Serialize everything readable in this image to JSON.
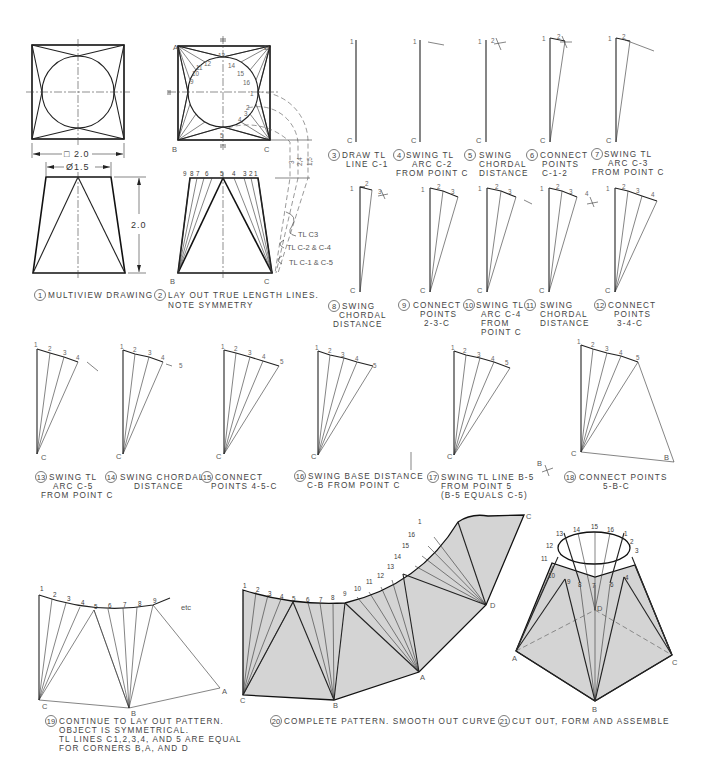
{
  "figure": {
    "steps": [
      {
        "n": "1",
        "lines": [
          "MULTIVIEW DRAWING"
        ]
      },
      {
        "n": "2",
        "lines": [
          "LAY OUT TRUE LENGTH LINES.",
          "NOTE SYMMETRY"
        ]
      },
      {
        "n": "3",
        "lines": [
          "DRAW TL",
          "LINE C-1"
        ]
      },
      {
        "n": "4",
        "lines": [
          "SWING TL",
          "ARC C-2",
          "FROM POINT C"
        ]
      },
      {
        "n": "5",
        "lines": [
          "SWING",
          "CHORDAL",
          "DISTANCE"
        ]
      },
      {
        "n": "6",
        "lines": [
          "CONNECT",
          "POINTS",
          "C-1-2"
        ]
      },
      {
        "n": "7",
        "lines": [
          "SWING TL",
          "ARC C-3",
          "FROM POINT C"
        ]
      },
      {
        "n": "8",
        "lines": [
          "SWING",
          "CHORDAL",
          "DISTANCE"
        ]
      },
      {
        "n": "9",
        "lines": [
          "CONNECT",
          "POINTS",
          "2-3-C"
        ]
      },
      {
        "n": "10",
        "lines": [
          "SWING TL",
          "ARC C-4",
          "FROM",
          "POINT C"
        ]
      },
      {
        "n": "11",
        "lines": [
          "SWING",
          "CHORDAL",
          "DISTANCE"
        ]
      },
      {
        "n": "12",
        "lines": [
          "CONNECT",
          "POINTS",
          "3-4-C"
        ]
      },
      {
        "n": "13",
        "lines": [
          "SWING TL",
          "ARC C-5",
          "FROM POINT C"
        ]
      },
      {
        "n": "14",
        "lines": [
          "SWING CHORDAL",
          "DISTANCE"
        ]
      },
      {
        "n": "15",
        "lines": [
          "CONNECT",
          "POINTS 4-5-C"
        ]
      },
      {
        "n": "16",
        "lines": [
          "SWING BASE DISTANCE",
          "C-B FROM POINT C"
        ]
      },
      {
        "n": "17",
        "lines": [
          "SWING TL LINE B-5",
          "FROM POINT 5",
          "(B-5 EQUALS C-5)"
        ]
      },
      {
        "n": "18",
        "lines": [
          "CONNECT POINTS",
          "5-B-C"
        ]
      },
      {
        "n": "19",
        "lines": [
          "CONTINUE TO LAY OUT PATTERN.",
          "OBJECT IS SYMMETRICAL.",
          "TL LINES C1,2,3,4, AND 5 ARE EQUAL",
          "FOR CORNERS B,A, AND D"
        ]
      },
      {
        "n": "20",
        "lines": [
          "COMPLETE PATTERN. SMOOTH OUT CURVE"
        ]
      },
      {
        "n": "21",
        "lines": [
          "CUT OUT, FORM AND ASSEMBLE"
        ]
      }
    ],
    "dimensions": {
      "square": "□ 2.0",
      "diameter": "Ø1.5",
      "height": "2.0"
    },
    "tl_labels": {
      "c3": "TL  C3",
      "c2c4": "TL  C-2  &  C-4",
      "c1c5": "TL  C-1  &  C-5",
      "tl_axis": [
        "3",
        "2,4",
        "1,5"
      ]
    },
    "points": {
      "A": "A",
      "B": "B",
      "C": "C",
      "D": "D",
      "etc": "etc"
    },
    "circle_numbers_top": [
      "9",
      "10",
      "11",
      "12",
      "13",
      "14",
      "15",
      "16",
      "1"
    ],
    "front_numbers": [
      "9",
      "8",
      "7",
      "6",
      "5",
      "4",
      "3",
      "2",
      "1"
    ],
    "pattern_numbers": [
      "1",
      "2",
      "3",
      "4",
      "5",
      "6",
      "7",
      "8",
      "9",
      "10",
      "11",
      "12",
      "13",
      "14",
      "15",
      "16",
      "1"
    ],
    "colors": {
      "ink": "#111111",
      "fill": "#d4d4d4",
      "background": "#ffffff"
    }
  }
}
